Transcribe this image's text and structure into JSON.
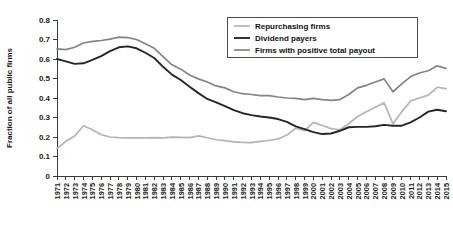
{
  "chart_data": {
    "type": "line",
    "title": "",
    "xlabel": "",
    "ylabel": "Fraction of all public firms",
    "ylim": [
      0,
      0.8
    ],
    "ytick_labels": [
      "0",
      "0.1",
      "0.2",
      "0.3",
      "0.4",
      "0.5",
      "0.6",
      "0.7",
      "0.8"
    ],
    "ytick_values": [
      0,
      0.1,
      0.2,
      0.3,
      0.4,
      0.5,
      0.6,
      0.7,
      0.8
    ],
    "grid": false,
    "legend_position": "top-right",
    "categories": [
      "1971",
      "1972",
      "1973",
      "1974",
      "1975",
      "1976",
      "1977",
      "1978",
      "1979",
      "1980",
      "1981",
      "1982",
      "1983",
      "1984",
      "1985",
      "1986",
      "1987",
      "1988",
      "1989",
      "1990",
      "1991",
      "1992",
      "1993",
      "1994",
      "1995",
      "1996",
      "1997",
      "1998",
      "1999",
      "2000",
      "2001",
      "2002",
      "2003",
      "2004",
      "2005",
      "2006",
      "2007",
      "2008",
      "2009",
      "2010",
      "2011",
      "2012",
      "2013",
      "2014",
      "2015"
    ],
    "series": [
      {
        "name": "Repurchasing firms",
        "color": "#b4b4b4",
        "width": 1.7,
        "values": [
          0.14,
          0.178,
          0.205,
          0.258,
          0.237,
          0.212,
          0.2,
          0.197,
          0.196,
          0.195,
          0.196,
          0.197,
          0.196,
          0.199,
          0.198,
          0.197,
          0.206,
          0.196,
          0.186,
          0.181,
          0.175,
          0.172,
          0.171,
          0.178,
          0.182,
          0.19,
          0.21,
          0.245,
          0.232,
          0.275,
          0.259,
          0.243,
          0.237,
          0.268,
          0.305,
          0.33,
          0.352,
          0.375,
          0.268,
          0.33,
          0.385,
          0.4,
          0.415,
          0.455,
          0.448
        ]
      },
      {
        "name": "Dividend payers",
        "color": "#262626",
        "width": 1.9,
        "values": [
          0.6,
          0.588,
          0.575,
          0.578,
          0.595,
          0.615,
          0.64,
          0.66,
          0.665,
          0.655,
          0.632,
          0.605,
          0.56,
          0.52,
          0.492,
          0.458,
          0.425,
          0.395,
          0.378,
          0.358,
          0.338,
          0.322,
          0.312,
          0.305,
          0.3,
          0.292,
          0.278,
          0.255,
          0.24,
          0.225,
          0.215,
          0.218,
          0.232,
          0.25,
          0.252,
          0.252,
          0.255,
          0.262,
          0.258,
          0.258,
          0.275,
          0.3,
          0.33,
          0.34,
          0.332
        ]
      },
      {
        "name": "Firms with positive total payout",
        "color": "#848484",
        "width": 1.7,
        "values": [
          0.652,
          0.648,
          0.66,
          0.682,
          0.69,
          0.695,
          0.702,
          0.712,
          0.71,
          0.7,
          0.678,
          0.655,
          0.612,
          0.57,
          0.548,
          0.518,
          0.498,
          0.482,
          0.462,
          0.452,
          0.432,
          0.422,
          0.418,
          0.412,
          0.412,
          0.405,
          0.4,
          0.398,
          0.392,
          0.398,
          0.392,
          0.388,
          0.392,
          0.418,
          0.452,
          0.465,
          0.482,
          0.498,
          0.432,
          0.472,
          0.51,
          0.528,
          0.54,
          0.565,
          0.552
        ]
      }
    ]
  },
  "legend": {
    "items": [
      {
        "label": "Repurchasing firms"
      },
      {
        "label": "Dividend payers"
      },
      {
        "label": "Firms with positive total payout"
      }
    ]
  }
}
